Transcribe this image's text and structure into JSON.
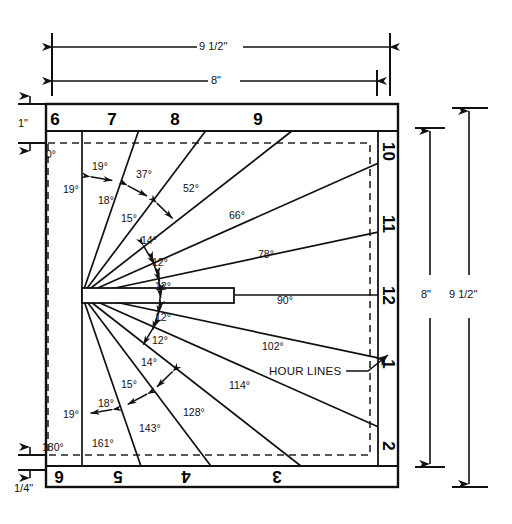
{
  "diagram": {
    "callout_label": "HOUR LINES",
    "stroke_color": "#111111",
    "dashed_color": "#222222",
    "background": "#ffffff"
  },
  "dimensions": {
    "top_outer": "9 1/2\"",
    "top_inner": "8\"",
    "left_top": "1\"",
    "left_bottom": "1/4\"",
    "right_inner": "8\"",
    "right_outer": "9 1/2\""
  },
  "hour_numbers": {
    "top": [
      {
        "label": "6",
        "x": 55,
        "y": 121
      },
      {
        "label": "7",
        "x": 112,
        "y": 121
      },
      {
        "label": "8",
        "x": 175,
        "y": 121
      },
      {
        "label": "9",
        "x": 258,
        "y": 121
      }
    ],
    "right": [
      {
        "label": "10",
        "x": 388,
        "y": 152
      },
      {
        "label": "11",
        "x": 388,
        "y": 225
      },
      {
        "label": "12",
        "x": 388,
        "y": 296
      },
      {
        "label": "1",
        "x": 388,
        "y": 365
      },
      {
        "label": "2",
        "x": 388,
        "y": 447
      }
    ],
    "bottom": [
      {
        "label": "6",
        "x": 59,
        "y": 477
      },
      {
        "label": "5",
        "x": 118,
        "y": 477
      },
      {
        "label": "4",
        "x": 186,
        "y": 477
      },
      {
        "label": "3",
        "x": 277,
        "y": 477
      }
    ]
  },
  "hour_line_angles": {
    "unit": "degrees",
    "values": [
      0,
      19,
      37,
      52,
      66,
      78,
      90,
      102,
      114,
      128,
      143,
      161,
      180
    ],
    "labels": [
      {
        "text": "0°",
        "x": 46,
        "y": 148
      },
      {
        "text": "19°",
        "x": 92,
        "y": 160
      },
      {
        "text": "37°",
        "x": 136,
        "y": 168
      },
      {
        "text": "52°",
        "x": 183,
        "y": 182
      },
      {
        "text": "66°",
        "x": 229,
        "y": 209
      },
      {
        "text": "78°",
        "x": 258,
        "y": 248
      },
      {
        "text": "90°",
        "x": 277,
        "y": 294
      },
      {
        "text": "102°",
        "x": 262,
        "y": 340
      },
      {
        "text": "114°",
        "x": 229,
        "y": 379
      },
      {
        "text": "128°",
        "x": 183,
        "y": 406
      },
      {
        "text": "143°",
        "x": 139,
        "y": 422
      },
      {
        "text": "161°",
        "x": 92,
        "y": 437
      },
      {
        "text": "180°",
        "x": 42,
        "y": 441
      }
    ]
  },
  "increment_angles": {
    "upper": [
      {
        "text": "19°",
        "x": 63,
        "y": 183
      },
      {
        "text": "18°",
        "x": 98,
        "y": 194
      },
      {
        "text": "15°",
        "x": 121,
        "y": 212
      },
      {
        "text": "14°",
        "x": 141,
        "y": 234
      },
      {
        "text": "12°",
        "x": 152,
        "y": 256
      },
      {
        "text": "12°",
        "x": 155,
        "y": 280
      }
    ],
    "lower": [
      {
        "text": "12°",
        "x": 155,
        "y": 311
      },
      {
        "text": "12°",
        "x": 152,
        "y": 334
      },
      {
        "text": "14°",
        "x": 141,
        "y": 356
      },
      {
        "text": "15°",
        "x": 121,
        "y": 378
      },
      {
        "text": "18°",
        "x": 98,
        "y": 397
      },
      {
        "text": "19°",
        "x": 63,
        "y": 408
      }
    ]
  },
  "geometry": {
    "origin_x": 82,
    "origin_y": 295,
    "plate_left": 46,
    "plate_right": 398,
    "plate_top": 104,
    "plate_bottom": 487
  }
}
